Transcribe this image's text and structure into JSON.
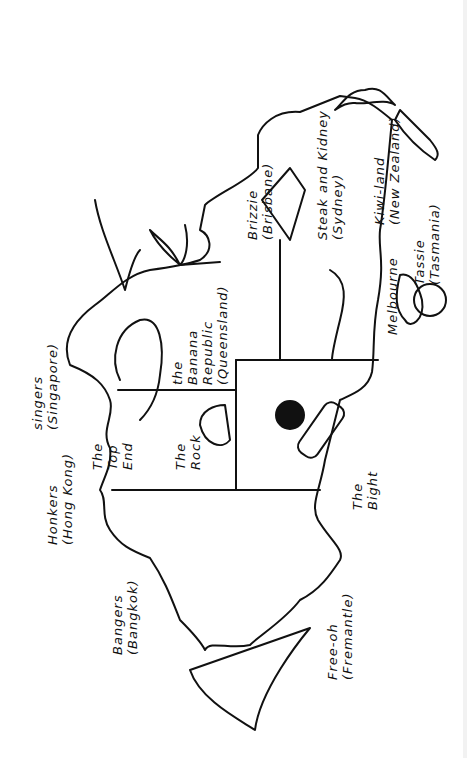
{
  "map": {
    "title": "Cartoon map of Australia with slang place names",
    "orientation": "rotated 90 degrees counter-clockwise",
    "colors": {
      "ink": "#111111",
      "paper": "#ffffff"
    },
    "regions": [
      {
        "id": "top-end",
        "label_lines": [
          "The",
          "Top",
          "End"
        ]
      },
      {
        "id": "the-rock",
        "label_lines": [
          "The",
          "Rock"
        ]
      },
      {
        "id": "queensland",
        "label_lines": [
          "the",
          "Banana",
          "Republic",
          "(Queensland)"
        ]
      },
      {
        "id": "the-bight",
        "label_lines": [
          "The",
          "Bight"
        ]
      }
    ],
    "places": [
      {
        "id": "singapore",
        "label": "singers",
        "real": "(Singapore)",
        "arrow": "↖"
      },
      {
        "id": "hong-kong",
        "label": "Honkers",
        "real": "(Hong Kong)",
        "arrow": "↖"
      },
      {
        "id": "bangkok",
        "label": "Bangers",
        "real": "(Bangkok)",
        "arrow": "↖"
      },
      {
        "id": "fremantle",
        "label": "Free-oh",
        "real": "(Fremantle)"
      },
      {
        "id": "brisbane",
        "label": "Brizzie",
        "real": "(Brisbane)"
      },
      {
        "id": "sydney",
        "label": "Steak and Kidney",
        "real": "(Sydney)"
      },
      {
        "id": "melbourne",
        "label": "Melbourne"
      },
      {
        "id": "tasmania",
        "label": "Tassie",
        "real": "(Tasmania)",
        "arrow": "←"
      },
      {
        "id": "new-zealand",
        "label": "Kiwi-land",
        "real": "(New Zealand)",
        "arrow": "→"
      }
    ],
    "illustrations": [
      "crocodile",
      "palm-tree",
      "shark",
      "opera-house",
      "wine-bottle-and-grapes",
      "apple",
      "sailboat-spinnaker",
      "uluru-rock"
    ]
  }
}
